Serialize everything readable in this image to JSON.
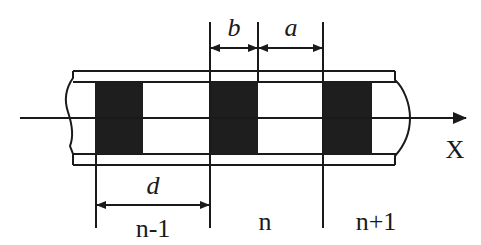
{
  "diagram": {
    "type": "periodic-structure-schematic",
    "axis_label": "X",
    "dimension_labels": {
      "b": "b",
      "a": "a",
      "d": "d"
    },
    "cell_labels": [
      "n-1",
      "n",
      "n+1"
    ],
    "blocks_count": 3,
    "colors": {
      "line": "#1a1a1a",
      "block_fill": "#1e1e1e",
      "background": "#ffffff"
    }
  }
}
